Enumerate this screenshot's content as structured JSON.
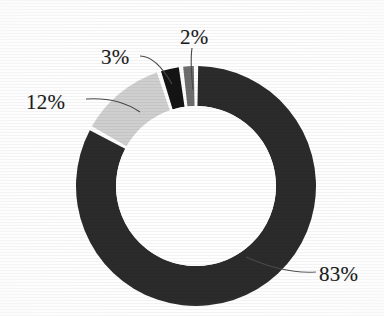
{
  "chart_data": {
    "type": "pie",
    "variant": "donut",
    "title": "",
    "subtitle": "",
    "xlabel": "",
    "ylabel": "",
    "legend": "none",
    "grid": false,
    "labels_show_percent": true,
    "start_angle_deg": 0,
    "direction": "clockwise",
    "center": {
      "x": 196,
      "y": 186
    },
    "outer_radius": 120,
    "inner_radius": 80,
    "categories": [
      "83%",
      "12%",
      "3%",
      "2%"
    ],
    "values": [
      83,
      12,
      3,
      2
    ],
    "slices": [
      {
        "label": "83%",
        "value": 83,
        "color": "#2b2b2b",
        "label_pos": {
          "x": 319,
          "y": 262
        },
        "leader": {
          "from": {
            "x": 316,
            "y": 272
          },
          "ctrl": {
            "x": 284,
            "y": 274
          },
          "to": {
            "x": 246,
            "y": 257
          }
        }
      },
      {
        "label": "12%",
        "value": 12,
        "color": "#cfcfcf",
        "label_pos": {
          "x": 26,
          "y": 90
        },
        "leader": {
          "from": {
            "x": 86,
            "y": 99
          },
          "ctrl": {
            "x": 118,
            "y": 97
          },
          "to": {
            "x": 140,
            "y": 112
          }
        }
      },
      {
        "label": "3%",
        "value": 3,
        "color": "#141414",
        "label_pos": {
          "x": 101,
          "y": 45
        },
        "leader": {
          "from": {
            "x": 140,
            "y": 56
          },
          "ctrl": {
            "x": 156,
            "y": 56
          },
          "to": {
            "x": 172,
            "y": 84
          }
        }
      },
      {
        "label": "2%",
        "value": 2,
        "color": "#6e6e6e",
        "label_pos": {
          "x": 180,
          "y": 25
        },
        "leader": {
          "from": {
            "x": 192,
            "y": 48
          },
          "ctrl": {
            "x": 190,
            "y": 62
          },
          "to": {
            "x": 193,
            "y": 90
          }
        }
      }
    ],
    "separator_color": "#ffffff",
    "background_color": "#ffffff",
    "hole_color": "#ffffff"
  },
  "labels": {
    "p83": "83%",
    "p12": "12%",
    "p3": "3%",
    "p2": "2%"
  }
}
